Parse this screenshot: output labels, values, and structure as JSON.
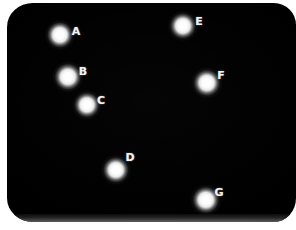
{
  "scene": {
    "title": "Labeled light points on dark background",
    "width": 296,
    "height": 230,
    "background_color": "#ffffff",
    "panel_color": "#000000",
    "point_color": "#ffffff",
    "label_color": "#f2f2f2"
  },
  "chart_data": {
    "type": "scatter",
    "xlabel": "",
    "ylabel": "",
    "xlim": [
      0,
      296
    ],
    "ylim": [
      230,
      0
    ],
    "grid": false,
    "legend": "none",
    "point_labels": [
      "A",
      "B",
      "C",
      "D",
      "E",
      "F",
      "G"
    ],
    "x": [
      60,
      68,
      87,
      116,
      183,
      207,
      206
    ],
    "y": [
      35,
      77,
      105,
      170,
      26,
      83,
      200
    ],
    "label_x": [
      76,
      83,
      101,
      130,
      199,
      221,
      219
    ],
    "label_y": [
      31,
      71,
      100,
      157,
      21,
      75,
      192
    ]
  },
  "points": [
    {
      "label": "A",
      "cx": 60,
      "cy": 35,
      "r": 6.0,
      "lx": 76,
      "ly": 31
    },
    {
      "label": "B",
      "cx": 68,
      "cy": 77,
      "r": 6.2,
      "lx": 83,
      "ly": 71
    },
    {
      "label": "C",
      "cx": 87,
      "cy": 105,
      "r": 5.8,
      "lx": 101,
      "ly": 100
    },
    {
      "label": "D",
      "cx": 116,
      "cy": 170,
      "r": 6.0,
      "lx": 130,
      "ly": 157
    },
    {
      "label": "E",
      "cx": 183,
      "cy": 26,
      "r": 6.0,
      "lx": 199,
      "ly": 21
    },
    {
      "label": "F",
      "cx": 207,
      "cy": 83,
      "r": 6.2,
      "lx": 221,
      "ly": 75
    },
    {
      "label": "G",
      "cx": 206,
      "cy": 200,
      "r": 6.2,
      "lx": 219,
      "ly": 192
    }
  ]
}
